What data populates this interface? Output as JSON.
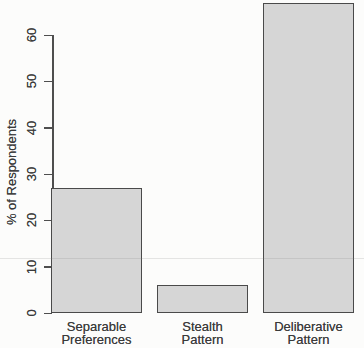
{
  "chart_data": {
    "type": "bar",
    "categories": [
      "Separable Preferences",
      "Stealth Pattern",
      "Deliberative Pattern"
    ],
    "values": [
      27,
      6,
      67
    ],
    "title": "",
    "xlabel": "",
    "ylabel": "% of Respondents",
    "ylim": [
      0,
      60
    ],
    "yticks": [
      0,
      10,
      20,
      30,
      40,
      50,
      60
    ],
    "grid": false,
    "legend": "none",
    "colors": {
      "bar_fill": "#d6d6d6",
      "bar_border": "#4a4a4a",
      "axis": "#4e4e4e",
      "text": "#3a3a3a",
      "background": "#fcfcfb"
    }
  }
}
